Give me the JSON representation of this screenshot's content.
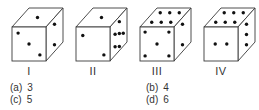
{
  "question": {
    "dice": [
      {
        "label": "I",
        "origin": [
          12,
          27
        ],
        "faces": {
          "top": [
            [
              0.5,
              0.5
            ]
          ],
          "front": [
            [
              0.18,
              0.18
            ],
            [
              0.5,
              0.5
            ],
            [
              0.82,
              0.82
            ]
          ],
          "right": [
            [
              0.5,
              0.2
            ],
            [
              0.5,
              0.8
            ]
          ]
        }
      },
      {
        "label": "II",
        "origin": [
          76,
          27
        ],
        "faces": {
          "top": [
            [
              0.5,
              0.5
            ]
          ],
          "front": [
            [
              0.2,
              0.25
            ],
            [
              0.82,
              0.82
            ]
          ],
          "right": [
            [
              0.55,
              0.15
            ],
            [
              0.3,
              0.38
            ],
            [
              0.55,
              0.5
            ],
            [
              0.78,
              0.62
            ],
            [
              0.3,
              0.75
            ],
            [
              0.55,
              0.88
            ]
          ]
        }
      },
      {
        "label": "III",
        "origin": [
          140,
          27
        ],
        "faces": {
          "top": [
            [
              0.22,
              0.25
            ],
            [
              0.5,
              0.25
            ],
            [
              0.78,
              0.25
            ],
            [
              0.22,
              0.75
            ],
            [
              0.5,
              0.75
            ],
            [
              0.78,
              0.75
            ]
          ],
          "front": [
            [
              0.15,
              0.15
            ],
            [
              0.85,
              0.15
            ],
            [
              0.5,
              0.5
            ],
            [
              0.15,
              0.85
            ],
            [
              0.85,
              0.85
            ]
          ],
          "right": [
            [
              0.5,
              0.2
            ],
            [
              0.5,
              0.8
            ]
          ]
        }
      },
      {
        "label": "IV",
        "origin": [
          204,
          27
        ],
        "faces": {
          "top": [
            [
              0.22,
              0.25
            ],
            [
              0.5,
              0.25
            ],
            [
              0.78,
              0.25
            ],
            [
              0.22,
              0.75
            ],
            [
              0.5,
              0.75
            ],
            [
              0.78,
              0.75
            ]
          ],
          "front": [
            [
              0.33,
              0.5
            ],
            [
              0.67,
              0.5
            ]
          ],
          "right": [
            [
              0.5,
              0.2
            ],
            [
              0.5,
              0.5
            ],
            [
              0.5,
              0.8
            ]
          ]
        }
      }
    ],
    "options": [
      {
        "key": "(a)",
        "value": "3",
        "x": 10,
        "y": 82
      },
      {
        "key": "(b)",
        "value": "4",
        "x": 146,
        "y": 82
      },
      {
        "key": "(c)",
        "value": "5",
        "x": 10,
        "y": 94
      },
      {
        "key": "(d)",
        "value": "6",
        "x": 146,
        "y": 94
      }
    ]
  },
  "colors": {
    "line": "#3a3a3a",
    "dot": "#111111"
  },
  "geometry": {
    "size": 34,
    "depth_x": 17,
    "depth_y": 19,
    "label_y": 66
  }
}
